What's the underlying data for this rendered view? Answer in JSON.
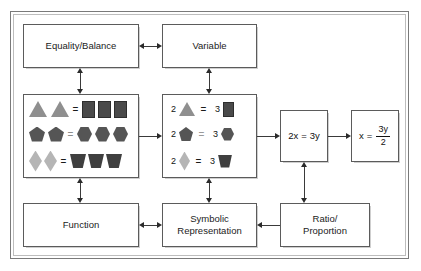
{
  "diagram": {
    "frame": {
      "label": "outer-frame"
    },
    "nodes": {
      "equality_balance": {
        "label": "Equality/Balance"
      },
      "variable": {
        "label": "Variable"
      },
      "function": {
        "label": "Function"
      },
      "symbolic_representation": {
        "label": "Symbolic\nRepresentation",
        "line1": "Symbolic",
        "line2": "Representation"
      },
      "ratio_proportion": {
        "label": "Ratio/\nProportion",
        "line1": "Ratio/",
        "line2": "Proportion"
      },
      "equation_1": {
        "label": "2x = 3y",
        "lhs": "2x",
        "op": "=",
        "rhs": "3y"
      },
      "equation_2": {
        "lhs": "x",
        "op": "=",
        "numerator": "3y",
        "denominator": "2"
      }
    },
    "pictorial_box": {
      "name": "pictorial-balance-box",
      "rows": [
        {
          "left_shape": "triangle",
          "left_count": 2,
          "operator": "=",
          "right_shape": "square",
          "right_count": 3
        },
        {
          "left_shape": "pentagon",
          "left_count": 2,
          "operator": "=",
          "right_shape": "hexagon",
          "right_count": 3
        },
        {
          "left_shape": "diamond",
          "left_count": 2,
          "operator": "=",
          "right_shape": "trapezoid",
          "right_count": 3
        }
      ]
    },
    "symbolic_box": {
      "name": "numeric-shape-box",
      "rows": [
        {
          "left_number": "2",
          "left_shape": "triangle",
          "operator": "=",
          "right_number": "3",
          "right_shape": "square"
        },
        {
          "left_number": "2",
          "left_shape": "pentagon",
          "operator": "=",
          "right_number": "3",
          "right_shape": "hexagon"
        },
        {
          "left_number": "2",
          "left_shape": "diamond",
          "operator": "=",
          "right_number": "3",
          "right_shape": "trapezoid"
        }
      ]
    },
    "connectors": [
      {
        "from": "equality_balance",
        "to": "variable",
        "type": "double-arrow",
        "orientation": "horizontal"
      },
      {
        "from": "equality_balance",
        "to": "pictorial_box",
        "type": "double-arrow",
        "orientation": "vertical"
      },
      {
        "from": "variable",
        "to": "symbolic_box",
        "type": "double-arrow",
        "orientation": "vertical"
      },
      {
        "from": "pictorial_box",
        "to": "symbolic_box",
        "type": "single-arrow",
        "orientation": "horizontal"
      },
      {
        "from": "pictorial_box",
        "to": "function",
        "type": "double-arrow",
        "orientation": "vertical"
      },
      {
        "from": "symbolic_box",
        "to": "symbolic_representation",
        "type": "double-arrow",
        "orientation": "vertical"
      },
      {
        "from": "symbolic_box",
        "to": "equation_1",
        "type": "single-arrow",
        "orientation": "horizontal"
      },
      {
        "from": "equation_1",
        "to": "equation_2",
        "type": "single-arrow",
        "orientation": "horizontal"
      },
      {
        "from": "equation_1",
        "to": "ratio_proportion",
        "type": "double-arrow",
        "orientation": "vertical"
      },
      {
        "from": "ratio_proportion",
        "to": "symbolic_representation",
        "type": "single-arrow",
        "orientation": "horizontal"
      },
      {
        "from": "function",
        "to": "symbolic_representation",
        "type": "double-arrow",
        "orientation": "horizontal"
      }
    ],
    "colors": {
      "box_border": "#5b5b5b",
      "frame_border": "#7a7a7a",
      "connector": "#3a3a3a",
      "light_shape": "#8f8f8f",
      "mid_shape": "#555555",
      "dark_shape": "#4a4a4a",
      "pale_shape": "#b5b5b5",
      "background": "#ffffff"
    }
  }
}
